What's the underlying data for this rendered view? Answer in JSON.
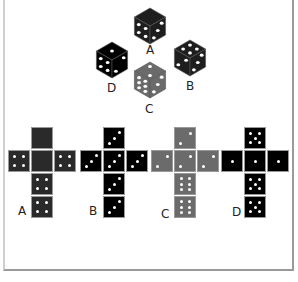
{
  "cubes": [
    {
      "label": "A",
      "color": "#1e1e1e",
      "faces": {
        "top": 0,
        "left": 4,
        "right": 3
      },
      "cx": 150,
      "cy": 26,
      "lx": 146,
      "ly": 44
    },
    {
      "label": "B",
      "color": "#1e1e1e",
      "faces": {
        "top": 4,
        "left": 2,
        "right": 3
      },
      "cx": 190,
      "cy": 58,
      "lx": 186,
      "ly": 80
    },
    {
      "label": "D",
      "color": "#000000",
      "faces": {
        "top": 1,
        "left": 4,
        "right": 2
      },
      "cx": 112,
      "cy": 60,
      "lx": 107,
      "ly": 82
    },
    {
      "label": "C",
      "color": "#6b6b6b",
      "faces": {
        "top": 2,
        "left": 6,
        "right": 3
      },
      "cx": 150,
      "cy": 80,
      "lx": 145,
      "ly": 103
    }
  ],
  "nets": [
    {
      "label": "A",
      "color": "#2a2a2a",
      "x": 8,
      "y": 127,
      "faces": {
        "top": 0,
        "left": 4,
        "center": 0,
        "right": 4,
        "bottom1": 4,
        "bottom2": 4
      },
      "lx": 18,
      "ly": 205
    },
    {
      "label": "B",
      "color": "#000000",
      "x": 80,
      "y": 127,
      "faces": {
        "top": 3,
        "left": 3,
        "center": 3,
        "right": 3,
        "bottom1": 3,
        "bottom2": 3
      },
      "lx": 89,
      "ly": 205
    },
    {
      "label": "C",
      "color": "#6b6b6b",
      "x": 151,
      "y": 127,
      "faces": {
        "top": 2,
        "left": 2,
        "center": 2,
        "right": 2,
        "bottom1": 6,
        "bottom2": 6
      },
      "lx": 161,
      "ly": 208
    },
    {
      "label": "D",
      "color": "#000000",
      "x": 221,
      "y": 127,
      "faces": {
        "top": 5,
        "left": 1,
        "center": 1,
        "right": 1,
        "bottom1": 5,
        "bottom2": 5
      },
      "lx": 232,
      "ly": 206
    }
  ]
}
